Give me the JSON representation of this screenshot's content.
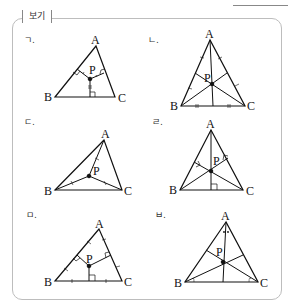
{
  "heading": {
    "text": "보기"
  },
  "box": {
    "label": "보기"
  },
  "items": [
    {
      "marker": "ㄱ.",
      "vertices": {
        "A": "A",
        "B": "B",
        "C": "C"
      },
      "point": "P",
      "construction": "perpendiculars to sides with equal marks (incenter)"
    },
    {
      "marker": "ㄴ.",
      "vertices": {
        "A": "A",
        "B": "B",
        "C": "C"
      },
      "point": "P",
      "construction": "medians (centroid)"
    },
    {
      "marker": "ㄷ.",
      "vertices": {
        "A": "A",
        "B": "B",
        "C": "C"
      },
      "point": "P",
      "construction": "segments PA, PB, PC equal (circumcenter)"
    },
    {
      "marker": "ㄹ.",
      "vertices": {
        "A": "A",
        "B": "B",
        "C": "C"
      },
      "point": "P",
      "construction": "altitudes (orthocenter)"
    },
    {
      "marker": "ㅁ.",
      "vertices": {
        "A": "A",
        "B": "B",
        "C": "C"
      },
      "point": "P",
      "construction": "perpendicular bisectors (circumcenter)"
    },
    {
      "marker": "ㅂ.",
      "vertices": {
        "A": "A",
        "B": "B",
        "C": "C"
      },
      "point": "P",
      "construction": "angle bisectors (incenter)"
    }
  ]
}
